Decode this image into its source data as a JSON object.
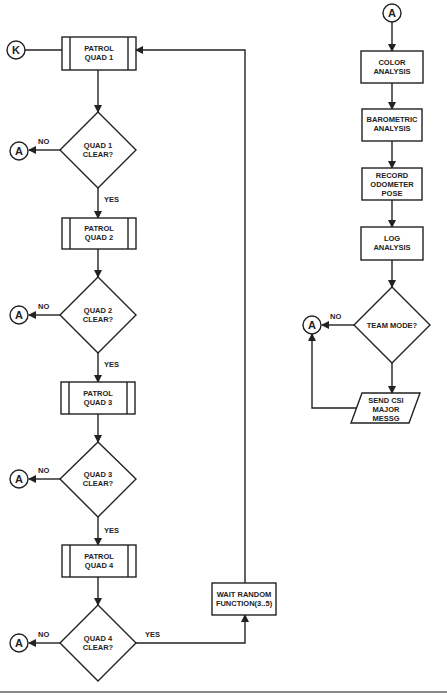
{
  "diagram": {
    "type": "flowchart",
    "connectors": {
      "k": "K",
      "a": "A"
    },
    "left_flow": {
      "patrol": [
        {
          "line1": "PATROL",
          "line2": "QUAD 1"
        },
        {
          "line1": "PATROL",
          "line2": "QUAD 2"
        },
        {
          "line1": "PATROL",
          "line2": "QUAD 3"
        },
        {
          "line1": "PATROL",
          "line2": "QUAD 4"
        }
      ],
      "decisions": [
        {
          "line1": "QUAD 1",
          "line2": "CLEAR?"
        },
        {
          "line1": "QUAD 2",
          "line2": "CLEAR?"
        },
        {
          "line1": "QUAD 3",
          "line2": "CLEAR?"
        },
        {
          "line1": "QUAD 4",
          "line2": "CLEAR?"
        }
      ],
      "wait": {
        "line1": "WAIT RANDOM",
        "line2": "FUNCTION(3..5)"
      }
    },
    "right_flow": {
      "color": {
        "line1": "COLOR",
        "line2": "ANALYSIS"
      },
      "barometric": {
        "line1": "BAROMETRIC",
        "line2": "ANALYSIS"
      },
      "record": {
        "line1": "RECORD",
        "line2": "ODOMETER",
        "line3": "POSE"
      },
      "log": {
        "line1": "LOG",
        "line2": "ANALYSIS"
      },
      "team": {
        "label": "TEAM MODE?"
      },
      "send": {
        "line1": "SEND CSI",
        "line2": "MAJOR",
        "line3": "MESSG"
      }
    },
    "edge_labels": {
      "yes": "YES",
      "no": "NO"
    }
  }
}
